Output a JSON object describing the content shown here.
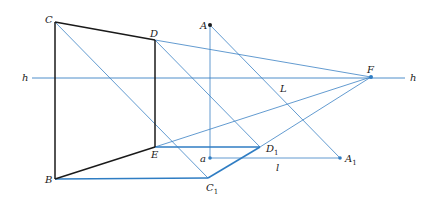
{
  "figure": {
    "colors": {
      "black_line": "#1a1a1a",
      "blue_line": "#3b82c4",
      "blue_thick": "#2f7dc3",
      "point": "#1a1a1a"
    },
    "horizon_label_left": "h",
    "horizon_label_right": "h",
    "labels": {
      "C": "C",
      "D": "D",
      "E": "E",
      "B": "B",
      "A": "A",
      "a": "a",
      "F": "F",
      "L": "L",
      "l": "l",
      "D1_base": "D",
      "D1_sub": "1",
      "C1_base": "C",
      "C1_sub": "1",
      "A1_base": "A",
      "A1_sub": "1"
    },
    "points": {
      "C": [
        55,
        22
      ],
      "D": [
        155,
        40
      ],
      "E": [
        155,
        147
      ],
      "B": [
        55,
        179
      ],
      "A": [
        210,
        25
      ],
      "a": [
        210,
        158
      ],
      "F": [
        371,
        77
      ],
      "D1": [
        260,
        147
      ],
      "C1": [
        208,
        178
      ],
      "A1": [
        340,
        158
      ]
    }
  }
}
